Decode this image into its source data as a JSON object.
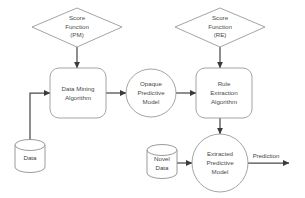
{
  "diagram": {
    "type": "flowchart",
    "title": "",
    "background_color": "#ffffff",
    "shape_stroke_color": "#9a9a9a",
    "connector_color": "#4a4a4a",
    "text_color": "#4a4a4a",
    "nodes": [
      {
        "id": "score-function-pm",
        "shape": "diamond",
        "lines": [
          "Score",
          "Function",
          "(PM)"
        ]
      },
      {
        "id": "score-function-re",
        "shape": "diamond",
        "lines": [
          "Score",
          "Function",
          "(RE)"
        ]
      },
      {
        "id": "data-mining-algorithm",
        "shape": "rounded-rectangle",
        "lines": [
          "Data Mining",
          "Algorithm"
        ]
      },
      {
        "id": "opaque-predictive-model",
        "shape": "ellipse",
        "lines": [
          "Opaque",
          "Predictive",
          "Model"
        ]
      },
      {
        "id": "rule-extraction-algorithm",
        "shape": "rounded-rectangle",
        "lines": [
          "Rule",
          "Extraction",
          "Algorithm"
        ]
      },
      {
        "id": "extracted-predictive-model",
        "shape": "ellipse",
        "lines": [
          "Extracted",
          "Predictive",
          "Model"
        ]
      },
      {
        "id": "data-store",
        "shape": "cylinder",
        "lines": [
          "Data"
        ]
      },
      {
        "id": "novel-data-store",
        "shape": "cylinder",
        "lines": [
          "Novel",
          "Data"
        ]
      }
    ],
    "edge_labels": [
      {
        "id": "prediction-label",
        "text": "Prediction"
      }
    ]
  }
}
